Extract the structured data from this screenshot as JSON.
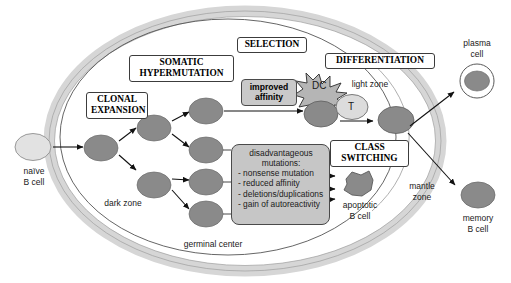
{
  "diagram": {
    "colors": {
      "gc_cell": "#8a8a8a",
      "naive_cell": "#e0e0e0",
      "mantle_band": "#d6d6d6",
      "box_gray": "#c6c6c6",
      "outline": "#4a4a4a",
      "arrow": "#111111",
      "text": "#1a1a1a"
    }
  },
  "process_labels": [
    {
      "id": "clonal-expansion",
      "text": "CLONAL\nEXPANSION"
    },
    {
      "id": "somatic-hypermutation",
      "text": "SOMATIC\nHYPERMUTATION"
    },
    {
      "id": "selection",
      "text": "SELECTION"
    },
    {
      "id": "differentiation",
      "text": "DIFFERENTIATION"
    },
    {
      "id": "class-switching",
      "text": "CLASS\nSWITCHING"
    }
  ],
  "affinity_box": {
    "text": "improved\naffinity"
  },
  "mutations_box": {
    "title": "disadvantageous\nmutations:",
    "items": [
      "- nonsense mutation",
      "- reduced affinity",
      "- deletions/duplications",
      "- gain of autoreactivity"
    ]
  },
  "zone_labels": [
    {
      "id": "dark-zone",
      "text": "dark zone"
    },
    {
      "id": "light-zone",
      "text": "light zone"
    },
    {
      "id": "mantle-zone",
      "text": "mantle\nzone"
    },
    {
      "id": "germinal-center",
      "text": "germinal center"
    }
  ],
  "cell_labels": [
    {
      "id": "naive-b-cell",
      "text": "naïve\nB cell"
    },
    {
      "id": "plasma-cell",
      "text": "plasma\ncell"
    },
    {
      "id": "memory-b-cell",
      "text": "memory\nB cell"
    },
    {
      "id": "apoptotic-b-cell",
      "text": "apoptotic\nB cell"
    }
  ],
  "cell_glyphs": [
    {
      "id": "dendritic-cell",
      "text": "DC"
    },
    {
      "id": "t-cell",
      "text": "T"
    }
  ]
}
